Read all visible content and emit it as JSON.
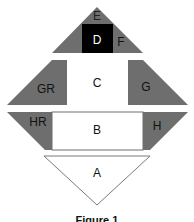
{
  "diagram": {
    "colors": {
      "gray": "#6e6e6e",
      "black": "#000000",
      "white": "#ffffff",
      "outline": "#7a7a7a"
    },
    "labels": {
      "E": "E",
      "D": "D",
      "F": "F",
      "GR": "GR",
      "C": "C",
      "G": "G",
      "HR": "HR",
      "B": "B",
      "H": "H",
      "A": "A"
    },
    "caption": "Figure 1"
  }
}
